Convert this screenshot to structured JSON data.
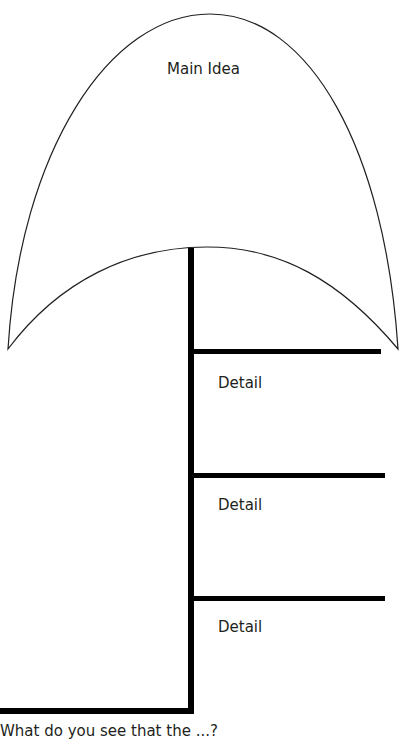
{
  "organizer": {
    "type": "main idea and details graphic organizer",
    "main_idea_label": "Main Idea",
    "details": [
      {
        "label": "Detail"
      },
      {
        "label": "Detail"
      },
      {
        "label": "Detail"
      }
    ],
    "footer_question": "What do you see that the ...?"
  },
  "colors": {
    "background": "#ffffff",
    "stroke": "#231f20",
    "bars": "#000000"
  }
}
